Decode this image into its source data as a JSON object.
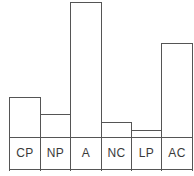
{
  "chart_data": {
    "type": "bar",
    "title": "",
    "subtitle": "",
    "xlabel": "",
    "ylabel": "",
    "categories": [
      "CP",
      "NP",
      "A",
      "NC",
      "LP",
      "AC"
    ],
    "values": [
      73,
      56,
      168,
      48,
      40,
      127
    ],
    "ylim": [
      0,
      170
    ],
    "grid": false,
    "legend": false,
    "legend_position": "none",
    "annotations": [],
    "tick_labels_x": [
      "CP",
      "NP",
      "A",
      "NC",
      "LP",
      "AC"
    ],
    "tick_labels_y": [],
    "series": [
      {
        "name": "",
        "values": [
          73,
          56,
          168,
          48,
          40,
          127
        ]
      }
    ]
  },
  "style": {
    "bar_fill": "#ffffff",
    "bar_stroke": "#555555",
    "axis_color": "#555555",
    "label_band_fill": "#f4f4f4",
    "label_text_color": "#3a3a3a",
    "background": "#ffffff"
  },
  "geometry": {
    "plot_left": 9,
    "plot_right": 192,
    "baseline_y": 170,
    "label_band_top": 137,
    "bar_edges": [
      9,
      40,
      70,
      101,
      131,
      161,
      192
    ],
    "bar_tops": [
      97,
      114,
      2,
      122,
      130,
      43
    ]
  }
}
